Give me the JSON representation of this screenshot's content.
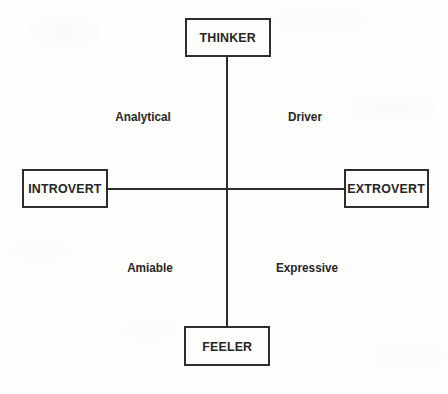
{
  "diagram": {
    "type": "quadrant-matrix",
    "background_color": "#fdfdfc",
    "stroke_color": "#2d2d2d",
    "text_color": "#262626",
    "axes": {
      "vertical": {
        "top_label": "THINKER",
        "bottom_label": "FEELER"
      },
      "horizontal": {
        "left_label": "INTROVERT",
        "right_label": "EXTROVERT"
      },
      "intersection": {
        "x": 227,
        "y": 189
      }
    },
    "nodes": [
      {
        "id": "thinker",
        "label": "THINKER",
        "position": "top",
        "x": 185,
        "y": 18,
        "width": 86,
        "height": 39
      },
      {
        "id": "introvert",
        "label": "INTROVERT",
        "position": "left",
        "x": 22,
        "y": 169,
        "width": 86,
        "height": 39
      },
      {
        "id": "extrovert",
        "label": "EXTROVERT",
        "position": "right",
        "x": 344,
        "y": 169,
        "width": 85,
        "height": 39
      },
      {
        "id": "feeler",
        "label": "FEELER",
        "position": "bottom",
        "x": 184,
        "y": 326,
        "width": 86,
        "height": 40
      }
    ],
    "quadrants": [
      {
        "id": "analytical",
        "label": "Analytical",
        "quadrant": "upper-left",
        "x": 143,
        "y": 117
      },
      {
        "id": "driver",
        "label": "Driver",
        "quadrant": "upper-right",
        "x": 305,
        "y": 117
      },
      {
        "id": "amiable",
        "label": "Amiable",
        "quadrant": "lower-left",
        "x": 150,
        "y": 268
      },
      {
        "id": "expressive",
        "label": "Expressive",
        "quadrant": "lower-right",
        "x": 307,
        "y": 268
      }
    ]
  }
}
